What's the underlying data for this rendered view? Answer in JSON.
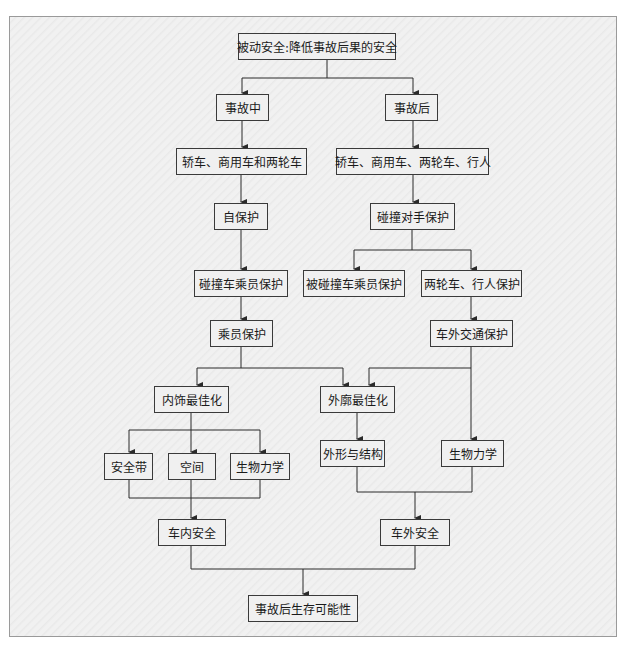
{
  "diagram": {
    "nodes": [
      {
        "id": "root",
        "label": "被动安全:降低事故后果的安全",
        "x": 238,
        "y": 33,
        "w": 158,
        "h": 27
      },
      {
        "id": "during",
        "label": "事故中",
        "x": 216,
        "y": 94,
        "w": 53,
        "h": 27
      },
      {
        "id": "after",
        "label": "事故后",
        "x": 385,
        "y": 94,
        "w": 53,
        "h": 27
      },
      {
        "id": "vehicles_left",
        "label": "轿车、商用车和两轮车",
        "x": 176,
        "y": 148,
        "w": 131,
        "h": 27
      },
      {
        "id": "vehicles_right",
        "label": "轿车、商用车、两轮车、行人",
        "x": 336,
        "y": 148,
        "w": 153,
        "h": 27
      },
      {
        "id": "self_protection",
        "label": "自保护",
        "x": 214,
        "y": 203,
        "w": 54,
        "h": 27
      },
      {
        "id": "partner_protection",
        "label": "碰撞对手保护",
        "x": 370,
        "y": 203,
        "w": 85,
        "h": 27
      },
      {
        "id": "occupant_crash",
        "label": "碰撞车乘员保护",
        "x": 194,
        "y": 270,
        "w": 94,
        "h": 27
      },
      {
        "id": "struck_occupant",
        "label": "被碰撞车乘员保护",
        "x": 303,
        "y": 270,
        "w": 102,
        "h": 27
      },
      {
        "id": "twowheel_ped",
        "label": "两轮车、行人保护",
        "x": 421,
        "y": 270,
        "w": 101,
        "h": 27
      },
      {
        "id": "occupant_protection",
        "label": "乘员保护",
        "x": 210,
        "y": 320,
        "w": 63,
        "h": 27
      },
      {
        "id": "external_traffic",
        "label": "车外交通保护",
        "x": 430,
        "y": 320,
        "w": 83,
        "h": 27
      },
      {
        "id": "interior_opt",
        "label": "内饰最佳化",
        "x": 154,
        "y": 386,
        "w": 75,
        "h": 27
      },
      {
        "id": "exterior_opt",
        "label": "外廓最佳化",
        "x": 320,
        "y": 386,
        "w": 75,
        "h": 27
      },
      {
        "id": "seatbelt",
        "label": "安全带",
        "x": 104,
        "y": 453,
        "w": 49,
        "h": 27
      },
      {
        "id": "space",
        "label": "空间",
        "x": 168,
        "y": 453,
        "w": 48,
        "h": 27
      },
      {
        "id": "biomech_left",
        "label": "生物力学",
        "x": 230,
        "y": 453,
        "w": 60,
        "h": 27
      },
      {
        "id": "shape_structure",
        "label": "外形与结构",
        "x": 320,
        "y": 440,
        "w": 65,
        "h": 27
      },
      {
        "id": "biomech_right",
        "label": "生物力学",
        "x": 441,
        "y": 440,
        "w": 63,
        "h": 27
      },
      {
        "id": "inside_safety",
        "label": "车内安全",
        "x": 158,
        "y": 519,
        "w": 68,
        "h": 27
      },
      {
        "id": "outside_safety",
        "label": "车外安全",
        "x": 380,
        "y": 519,
        "w": 70,
        "h": 27
      },
      {
        "id": "survival",
        "label": "事故后生存可能性",
        "x": 248,
        "y": 595,
        "w": 110,
        "h": 27
      }
    ]
  },
  "colors": {
    "line": "#2a2a2a",
    "box_border": "#3a3a3a",
    "box_fill": "#f0f0f0",
    "frame_border": "#9a9a9a"
  }
}
